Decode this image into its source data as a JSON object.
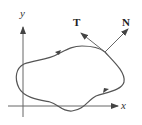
{
  "diagram": {
    "type": "closed-curve-with-tangent-normal",
    "axes": {
      "x_label": "x",
      "y_label": "y"
    },
    "vectors": [
      {
        "name": "tangent",
        "label": "T"
      },
      {
        "name": "normal",
        "label": "N"
      }
    ],
    "curve": {
      "orientation": "counterclockwise",
      "direction_arrows": 2
    },
    "colors": {
      "curve": "#555555",
      "axes": "#666666",
      "vectors": "#666666",
      "labels": "#222222"
    }
  }
}
